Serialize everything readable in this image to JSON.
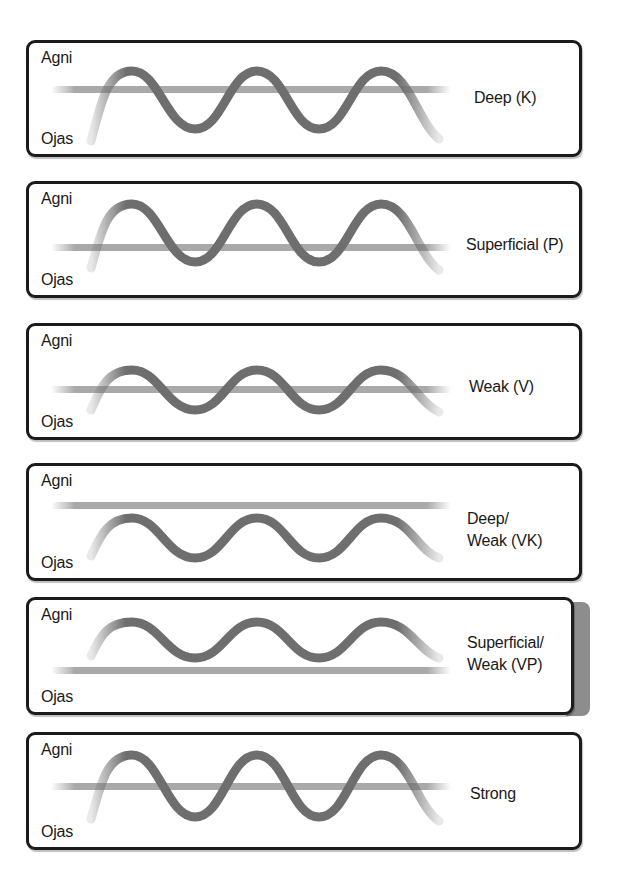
{
  "diagram": {
    "axis_labels": {
      "top": "Agni",
      "bottom": "Ojas"
    },
    "colors": {
      "border": "#1b1b1b",
      "wave": "#6e6e6e",
      "baseline": "#a9a9a9",
      "shadow_band": "#8d8d8d"
    },
    "panels": [
      {
        "id": "deep",
        "top_label": "Agni",
        "bottom_label": "Ojas",
        "state_lines": [
          "Deep (K)"
        ],
        "baseline_position": "middle",
        "wave_amplitude": "large",
        "wave_offset": "lower"
      },
      {
        "id": "superficial",
        "top_label": "Agni",
        "bottom_label": "Ojas",
        "state_lines": [
          "Superficial (P)"
        ],
        "baseline_position": "middle-low",
        "wave_amplitude": "large",
        "wave_offset": "higher"
      },
      {
        "id": "weak",
        "top_label": "Agni",
        "bottom_label": "Ojas",
        "state_lines": [
          "Weak (V)"
        ],
        "baseline_position": "middle",
        "wave_amplitude": "small",
        "wave_offset": "centered"
      },
      {
        "id": "deep-weak",
        "top_label": "Agni",
        "bottom_label": "Ojas",
        "state_lines": [
          "Deep/",
          "Weak (VK)"
        ],
        "baseline_position": "high",
        "wave_amplitude": "small",
        "wave_offset": "below-baseline"
      },
      {
        "id": "superficial-weak",
        "top_label": "Agni",
        "bottom_label": "Ojas",
        "state_lines": [
          "Superficial/",
          "Weak (VP)"
        ],
        "baseline_position": "low",
        "wave_amplitude": "small",
        "wave_offset": "above-baseline"
      },
      {
        "id": "strong",
        "top_label": "Agni",
        "bottom_label": "Ojas",
        "state_lines": [
          "Strong"
        ],
        "baseline_position": "middle",
        "wave_amplitude": "large",
        "wave_offset": "centered"
      }
    ]
  }
}
